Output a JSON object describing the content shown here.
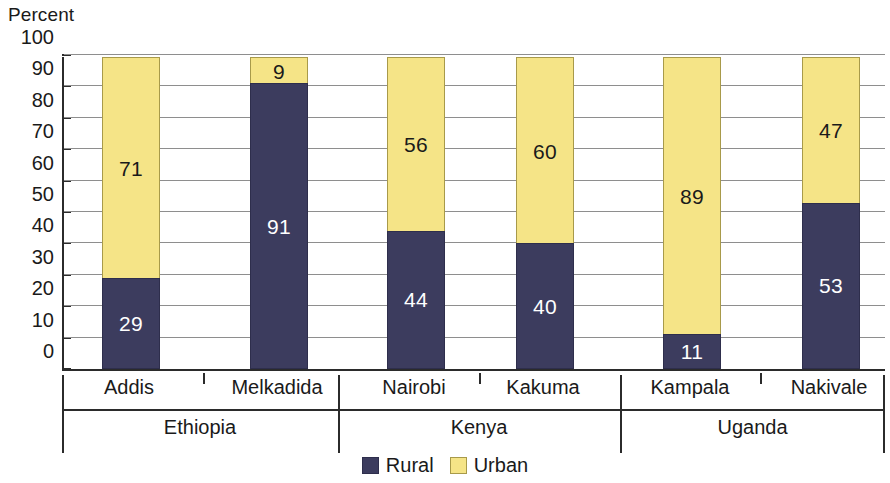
{
  "chart_data": {
    "type": "bar",
    "subtype": "stacked-bar-100",
    "title": "",
    "ylabel": "Percent",
    "xlabel": "",
    "ylim": [
      0,
      100
    ],
    "yticks": [
      0,
      10,
      20,
      30,
      40,
      50,
      60,
      70,
      80,
      90,
      100
    ],
    "ytick_labels": [
      "0",
      "10",
      "20",
      "30",
      "40",
      "50",
      "60",
      "70",
      "80",
      "90",
      "100"
    ],
    "grid": true,
    "legend_position": "bottom",
    "categories": [
      "Addis",
      "Melkadida",
      "Nairobi",
      "Kakuma",
      "Kampala",
      "Nakivale"
    ],
    "groups": [
      {
        "label": "Ethiopia",
        "categories": [
          "Addis",
          "Melkadida"
        ]
      },
      {
        "label": "Kenya",
        "categories": [
          "Nairobi",
          "Kakuma"
        ]
      },
      {
        "label": "Uganda",
        "categories": [
          "Kampala",
          "Nakivale"
        ]
      }
    ],
    "series": [
      {
        "name": "Rural",
        "color": "#3c3c5e",
        "values": [
          29,
          91,
          44,
          40,
          11,
          53
        ]
      },
      {
        "name": "Urban",
        "color": "#f5e487",
        "values": [
          71,
          9,
          56,
          60,
          89,
          47
        ]
      }
    ],
    "bars": [
      {
        "category": "Addis",
        "group": "Ethiopia",
        "rural": 29,
        "urban": 71
      },
      {
        "category": "Melkadida",
        "group": "Ethiopia",
        "rural": 91,
        "urban": 9
      },
      {
        "category": "Nairobi",
        "group": "Kenya",
        "rural": 44,
        "urban": 56
      },
      {
        "category": "Kakuma",
        "group": "Kenya",
        "rural": 40,
        "urban": 60
      },
      {
        "category": "Kampala",
        "group": "Uganda",
        "rural": 11,
        "urban": 89
      },
      {
        "category": "Nakivale",
        "group": "Uganda",
        "rural": 53,
        "urban": 47
      }
    ],
    "legend": [
      {
        "label": "Rural",
        "color": "#3c3c5e"
      },
      {
        "label": "Urban",
        "color": "#f5e487"
      }
    ]
  },
  "axis": {
    "y_title": "Percent"
  },
  "colors": {
    "rural": "#3c3c5e",
    "urban": "#f5e487",
    "axis": "#2b2b2b",
    "grid": "#8e8e8e",
    "text": "#1a1a1a"
  }
}
